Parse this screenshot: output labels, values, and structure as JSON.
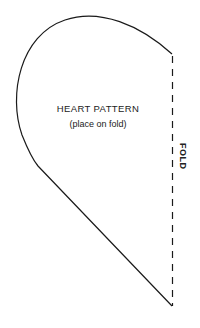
{
  "pattern": {
    "title": "HEART PATTERN",
    "subtitle": "(place on fold)",
    "fold_label": "FOLD"
  },
  "colors": {
    "line": "#1a1a1a",
    "background": "#ffffff"
  }
}
